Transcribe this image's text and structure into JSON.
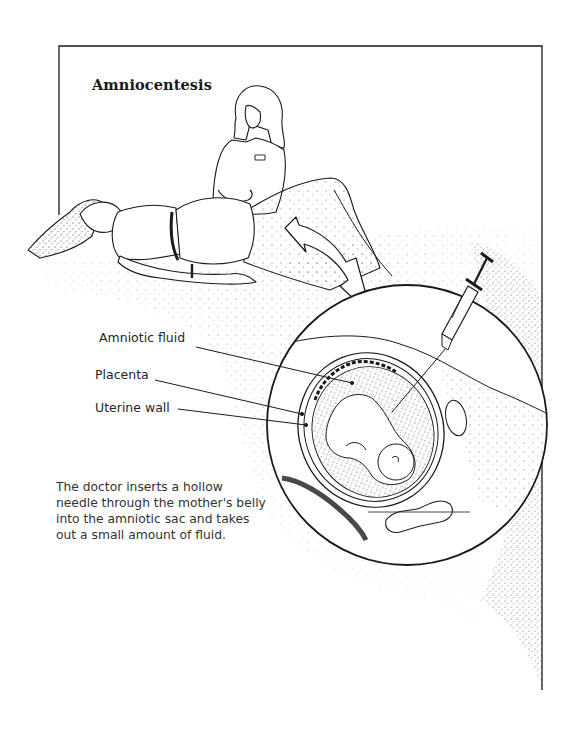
{
  "figure": {
    "title": "Amniocentesis",
    "labels": {
      "amniotic_fluid": "Amniotic fluid",
      "placenta": "Placenta",
      "uterine_wall": "Uterine wall"
    },
    "caption_lines": [
      "The doctor inserts a hollow",
      "needle through the mother's belly",
      "into the amniotic sac and takes",
      "out a small amount of fluid."
    ],
    "scene": {
      "figures": [
        "doctor",
        "pregnant-woman-lying-down"
      ],
      "inset": "cross-section-of-uterus-with-fetus",
      "instrument": "syringe-with-needle",
      "arrow": "curved-double-headed-arrow"
    },
    "colors": {
      "ink": "#1a1a1a",
      "text": "#333333",
      "paper": "#ffffff"
    }
  }
}
